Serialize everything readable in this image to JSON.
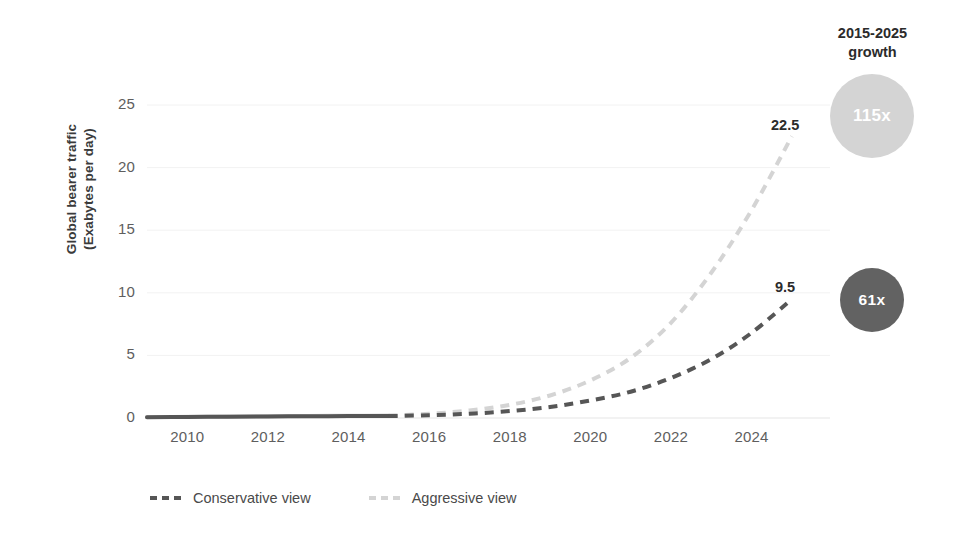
{
  "chart_data": {
    "type": "line",
    "title": "",
    "xlabel": "",
    "ylabel": "Global bearer traffic\n(Exabytes per day)",
    "ylabel_line1": "Global bearer traffic",
    "ylabel_line2": "(Exabytes per day)",
    "xlim": [
      2009,
      2025.5
    ],
    "ylim": [
      0,
      26.5
    ],
    "grid": true,
    "grid_axis": "y",
    "legend_position": "bottom-left",
    "x_ticks": [
      "2010",
      "2012",
      "2014",
      "2016",
      "2018",
      "2020",
      "2022",
      "2024"
    ],
    "x_tick_values": [
      2010,
      2012,
      2014,
      2016,
      2018,
      2020,
      2022,
      2024
    ],
    "y_ticks": [
      "0",
      "5",
      "10",
      "15",
      "20",
      "25"
    ],
    "y_tick_values": [
      0,
      5,
      10,
      15,
      20,
      25
    ],
    "x": [
      2009,
      2010,
      2011,
      2012,
      2013,
      2014,
      2015,
      2016,
      2017,
      2018,
      2019,
      2020,
      2021,
      2022,
      2023,
      2024,
      2025
    ],
    "series": [
      {
        "name": "Conservative view",
        "color": "#565656",
        "style": "dashed",
        "historical_style": "solid",
        "historical_end_year": 2015,
        "end_label": "9.5",
        "end_value": 9.5,
        "growth_label": "61x",
        "values": [
          0.06,
          0.08,
          0.1,
          0.12,
          0.14,
          0.15,
          0.155,
          0.22,
          0.34,
          0.55,
          0.88,
          1.4,
          2.1,
          3.2,
          4.7,
          6.8,
          9.5
        ]
      },
      {
        "name": "Aggressive view",
        "color": "#d4d4d4",
        "style": "dashed",
        "historical_style": "solid",
        "historical_end_year": 2015,
        "end_label": "22.5",
        "end_value": 22.5,
        "growth_label": "115x",
        "values": [
          0.07,
          0.09,
          0.11,
          0.13,
          0.16,
          0.18,
          0.195,
          0.34,
          0.6,
          1.05,
          1.8,
          3.0,
          4.8,
          7.6,
          11.6,
          16.6,
          22.5
        ]
      }
    ],
    "annotations": [
      {
        "text": "22.5",
        "series": "Aggressive view",
        "x": 2025,
        "y": 22.5
      },
      {
        "text": "9.5",
        "series": "Conservative view",
        "x": 2025,
        "y": 9.5
      }
    ]
  },
  "growth_panel": {
    "title_line1": "2015-2025",
    "title_line2": "growth",
    "bubbles": [
      {
        "label": "115x",
        "series": "Aggressive view",
        "color": "#d4d4d4",
        "text_color": "#ffffff"
      },
      {
        "label": "61x",
        "series": "Conservative view",
        "color": "#626262",
        "text_color": "#ffffff"
      }
    ]
  },
  "legend": {
    "items": [
      {
        "label": "Conservative view",
        "color": "#565656"
      },
      {
        "label": "Aggressive view",
        "color": "#d4d4d4"
      }
    ]
  },
  "colors": {
    "conservative": "#565656",
    "aggressive": "#d4d4d4",
    "bubble_dark": "#626262",
    "bubble_light": "#d4d4d4",
    "tick_text": "#5e5e5e",
    "title_text": "#2b2b2b",
    "grid": "#f2f2f2",
    "background": "#ffffff"
  }
}
